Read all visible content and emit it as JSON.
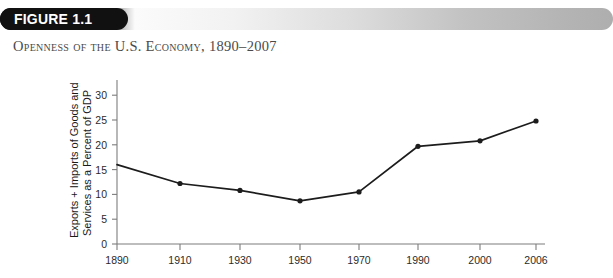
{
  "header": {
    "badge_label": "FIGURE 1.1",
    "title": "Openness of the U.S. Economy, 1890–2007",
    "badge_color": "#111111",
    "badge_text_color": "#ffffff",
    "bar_gradient_from": "#111111",
    "bar_gradient_to": "#aeaeae"
  },
  "chart_data": {
    "type": "line",
    "title": "",
    "subtitle": "",
    "xlabel": "",
    "ylabel": "Exports + Imports of Goods and Services as a Percent of GDP",
    "ylabel_line1": "Exports + Imports of Goods and",
    "ylabel_line2": "Services as a Percent of GDP",
    "categories": [
      "1890",
      "1910",
      "1930",
      "1950",
      "1970",
      "1990",
      "2000",
      "2006"
    ],
    "x": [
      1890,
      1910,
      1930,
      1950,
      1970,
      1990,
      2000,
      2006
    ],
    "values": [
      16.0,
      12.2,
      10.8,
      8.7,
      10.5,
      19.7,
      20.8,
      24.8
    ],
    "series": [
      {
        "name": "Exports + Imports as Percent of GDP",
        "values": [
          16.0,
          12.2,
          10.8,
          8.7,
          10.5,
          19.7,
          20.8,
          24.8
        ]
      }
    ],
    "ylim": [
      0,
      32
    ],
    "yticks": [
      0,
      5,
      10,
      15,
      20,
      25,
      30
    ],
    "ytick_labels": [
      "0",
      "5",
      "10",
      "15",
      "20",
      "25",
      "30"
    ],
    "xtick_labels": [
      "1890",
      "1910",
      "1930",
      "1950",
      "1970",
      "1990",
      "2000",
      "2006"
    ],
    "grid": false,
    "legend": false,
    "legend_position": "none",
    "line_color": "#1c1c1c",
    "marker": "circle",
    "axis_color": "#7d7d7d",
    "first_point_has_marker": false,
    "note": "First plotted value at 1890 begins at axis without a visible marker dot"
  }
}
